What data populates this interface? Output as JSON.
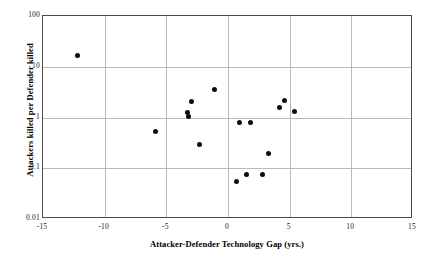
{
  "chart_data": {
    "type": "scatter",
    "title": "",
    "xlabel": "Attacker-Defender Technology Gap (yrs.)",
    "ylabel": "Attackers killed per Defender killed",
    "xlim": [
      -15,
      15
    ],
    "ylim": [
      0.01,
      100
    ],
    "yscale": "log",
    "xscale": "linear",
    "grid": true,
    "legend": null,
    "xticks": [
      {
        "value": -15,
        "label": "-15"
      },
      {
        "value": -10,
        "label": "-10"
      },
      {
        "value": -5,
        "label": "-5"
      },
      {
        "value": 0,
        "label": "0"
      },
      {
        "value": 5,
        "label": "5"
      },
      {
        "value": 10,
        "label": "10"
      },
      {
        "value": 15,
        "label": "15"
      }
    ],
    "yticks": [
      {
        "value": 100,
        "label": "100"
      },
      {
        "value": 10,
        "label": "10"
      },
      {
        "value": 1,
        "label": "1"
      },
      {
        "value": 0.1,
        "label": "0.1"
      },
      {
        "value": 0.01,
        "label": "0.01"
      }
    ],
    "marker": {
      "shape": "circle",
      "color": "#0d0d0d",
      "size": 5
    },
    "points": [
      {
        "x": -12.2,
        "y": 17
      },
      {
        "x": -5.9,
        "y": 0.52
      },
      {
        "x": -3.0,
        "y": 2.1
      },
      {
        "x": -3.3,
        "y": 1.25
      },
      {
        "x": -3.2,
        "y": 1.05
      },
      {
        "x": -2.3,
        "y": 0.3
      },
      {
        "x": -1.1,
        "y": 3.6
      },
      {
        "x": 0.7,
        "y": 0.055
      },
      {
        "x": 0.9,
        "y": 0.8
      },
      {
        "x": 1.5,
        "y": 0.075
      },
      {
        "x": 1.8,
        "y": 0.8
      },
      {
        "x": 2.8,
        "y": 0.075
      },
      {
        "x": 3.3,
        "y": 0.2
      },
      {
        "x": 4.2,
        "y": 1.6
      },
      {
        "x": 4.6,
        "y": 2.2
      },
      {
        "x": 5.4,
        "y": 1.3
      }
    ]
  }
}
